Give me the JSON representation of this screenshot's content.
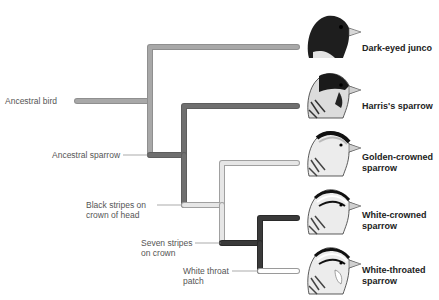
{
  "diagram": {
    "type": "phylogenetic-tree",
    "colors": {
      "ancestral": "#a3a3a3",
      "sparrow_lineage": "#6e6e6e",
      "black_stripes": "#e2e2e2",
      "seven_stripes": "#333333",
      "white_throat": "#ffffff",
      "stroke_outline": "#9a9a9a"
    },
    "nodes": [
      {
        "id": "ancestral-bird",
        "label": "Ancestral bird"
      },
      {
        "id": "ancestral-sparrow",
        "label": "Ancestral sparrow"
      },
      {
        "id": "black-stripes",
        "label_line1": "Black stripes on",
        "label_line2": "crown of head"
      },
      {
        "id": "seven-stripes",
        "label_line1": "Seven stripes",
        "label_line2": "on crown"
      },
      {
        "id": "white-throat",
        "label_line1": "White throat",
        "label_line2": "patch"
      }
    ],
    "species": [
      {
        "name": "Dark-eyed junco",
        "line1": "Dark-eyed junco",
        "line2": ""
      },
      {
        "name": "Harris's sparrow",
        "line1": "Harris's sparrow",
        "line2": ""
      },
      {
        "name": "Golden-crowned sparrow",
        "line1": "Golden-crowned",
        "line2": "sparrow"
      },
      {
        "name": "White-crowned sparrow",
        "line1": "White-crowned",
        "line2": "sparrow"
      },
      {
        "name": "White-throated sparrow",
        "line1": "White-throated",
        "line2": "sparrow"
      }
    ]
  }
}
